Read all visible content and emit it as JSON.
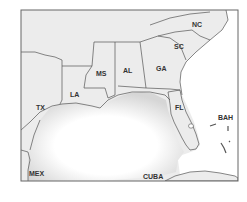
{
  "map": {
    "title": "Southeastern United States",
    "colors": {
      "land": "#ececec",
      "water": "#ffffff",
      "border": "#555555",
      "frame": "#666666"
    },
    "labels": {
      "nc": "NC",
      "sc": "SC",
      "ga": "GA",
      "al": "AL",
      "ms": "MS",
      "la": "LA",
      "tx": "TX",
      "fl": "FL",
      "bah": "BAH",
      "mex": "MEX",
      "cuba": "CUBA"
    }
  }
}
